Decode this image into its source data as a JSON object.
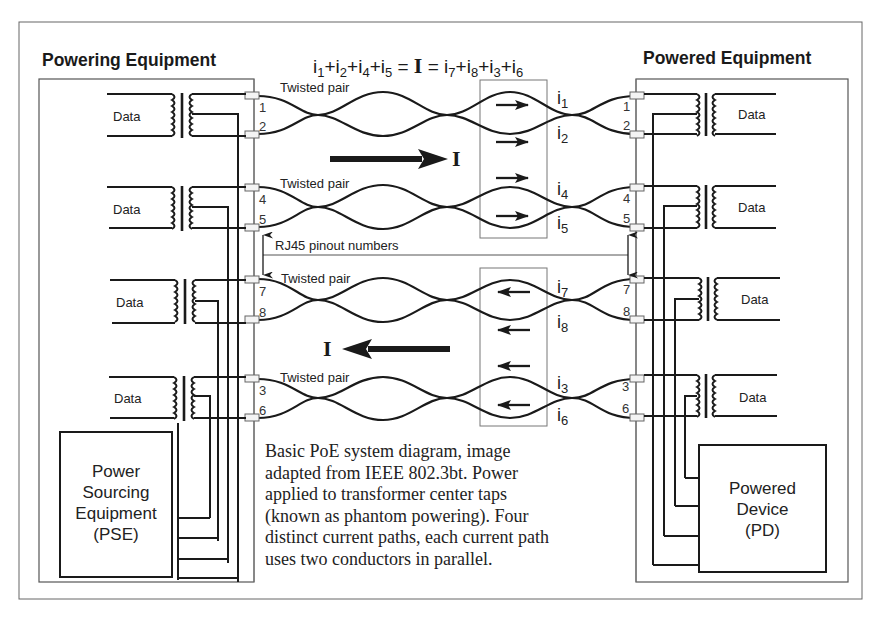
{
  "figure": {
    "left_section_title": "Powering Equipment",
    "right_section_title": "Powered Equipment",
    "equation": {
      "lhs": [
        {
          "i": "i",
          "n": "1"
        },
        {
          "i": "i",
          "n": "2"
        },
        {
          "i": "i",
          "n": "4"
        },
        {
          "i": "i",
          "n": "5"
        }
      ],
      "total": "I",
      "rhs": [
        {
          "i": "i",
          "n": "7"
        },
        {
          "i": "i",
          "n": "8"
        },
        {
          "i": "i",
          "n": "3"
        },
        {
          "i": "i",
          "n": "6"
        }
      ]
    },
    "twisted_pair_label": "Twisted pair",
    "pinout_label": "RJ45 pinout numbers",
    "data_label": "Data",
    "total_current_symbol": "I",
    "pairs": [
      {
        "pins": [
          "1",
          "2"
        ],
        "currents": [
          "1",
          "2"
        ],
        "direction": "right"
      },
      {
        "pins": [
          "4",
          "5"
        ],
        "currents": [
          "4",
          "5"
        ],
        "direction": "right"
      },
      {
        "pins": [
          "7",
          "8"
        ],
        "currents": [
          "7",
          "8"
        ],
        "direction": "left"
      },
      {
        "pins": [
          "3",
          "6"
        ],
        "currents": [
          "3",
          "6"
        ],
        "direction": "left"
      }
    ],
    "pse_box": {
      "line1": "Power",
      "line2": "Sourcing",
      "line3": "Equipment",
      "line4": "(PSE)"
    },
    "pd_box": {
      "line1": "Powered",
      "line2": "Device",
      "line3": "(PD)"
    },
    "caption": {
      "line1": "Basic PoE system diagram, image",
      "line2": "adapted from IEEE 802.3bt. Power",
      "line3": "applied to transformer center taps",
      "line4": "(known as phantom powering). Four",
      "line5": "distinct current paths, each current path",
      "line6": "uses two conductors in parallel."
    },
    "colors": {
      "line": "#1a1a1a",
      "frame": "#555555",
      "connector": "#f4f4f4"
    }
  }
}
